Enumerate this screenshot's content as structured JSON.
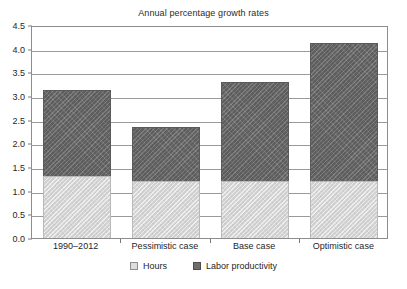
{
  "chart_data": {
    "type": "bar",
    "subtype": "stacked-bar",
    "title": "Annual percentage growth rates",
    "xlabel": "",
    "ylabel": "",
    "categories": [
      "1990–2012",
      "Pessimistic case",
      "Base case",
      "Optimistic case"
    ],
    "series": [
      {
        "name": "Hours",
        "values": [
          1.31,
          1.21,
          1.21,
          1.2
        ],
        "color": "#d9d9d9"
      },
      {
        "name": "Labor productivity",
        "values": [
          1.82,
          1.14,
          2.09,
          2.91
        ],
        "color": "#6e6e6e"
      }
    ],
    "totals": [
      3.13,
      2.35,
      3.3,
      4.11
    ],
    "ylim": [
      0.0,
      4.5
    ],
    "ytick_step": 0.5,
    "yticks": [
      "4.5",
      "4.0",
      "3.5",
      "3.0",
      "2.5",
      "2.0",
      "1.5",
      "1.0",
      "0.5",
      "0.0"
    ],
    "ytick_values": [
      4.5,
      4.0,
      3.5,
      3.0,
      2.5,
      2.0,
      1.5,
      1.0,
      0.5,
      0.0
    ],
    "grid": true,
    "grid_axis": "y",
    "legend_position": "bottom"
  },
  "legend": {
    "items": [
      {
        "label": "Hours",
        "swatch": "hours-swatch"
      },
      {
        "label": "Labor productivity",
        "swatch": "productivity-swatch"
      }
    ]
  }
}
